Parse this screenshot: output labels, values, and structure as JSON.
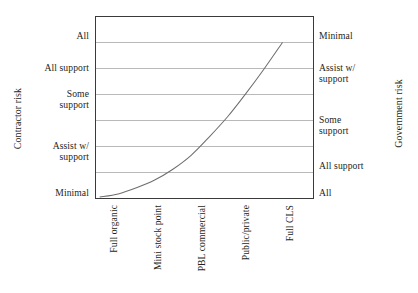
{
  "chart_data": {
    "type": "line",
    "title": "",
    "xlabel": "",
    "ylabel": "Contractor risk",
    "y2label": "Government risk",
    "grid": true,
    "legend": "none",
    "categories": [
      "Full organic",
      "Mini stock point",
      "PBL commercial",
      "Public/private",
      "Full CLS"
    ],
    "y_left_ticks": [
      "All",
      "All support",
      "Some support",
      "Assist w/ support",
      "Minimal"
    ],
    "y_right_ticks": [
      "Minimal",
      "Assist w/ support",
      "Some support",
      "All support",
      "All"
    ],
    "y_left_ticks_lines": [
      [
        "All"
      ],
      [
        "All support"
      ],
      [
        "Some",
        "support"
      ],
      [
        "Assist w/",
        "support"
      ],
      [
        "Minimal"
      ]
    ],
    "y_right_ticks_lines": [
      [
        "Minimal"
      ],
      [
        "Assist w/",
        "support"
      ],
      [
        "Some",
        "support"
      ],
      [
        "All support"
      ],
      [
        "All"
      ]
    ],
    "series": [
      {
        "name": "risk transfer curve",
        "color": "#6e6e6e",
        "x": [
          0.0,
          0.1,
          0.2,
          0.3,
          0.4,
          0.5,
          0.6,
          0.7,
          0.8,
          0.9,
          1.0
        ],
        "values": [
          0.0,
          0.02,
          0.06,
          0.11,
          0.18,
          0.27,
          0.39,
          0.52,
          0.67,
          0.83,
          1.0
        ]
      }
    ],
    "xlim": [
      0,
      1
    ],
    "ylim": [
      0,
      1
    ],
    "gridline_count": 6
  },
  "axes": {
    "left_title": "Contractor risk",
    "right_title": "Government risk"
  },
  "colors": {
    "frame": "#3a3a3a",
    "grid": "#b9b9b9",
    "curve": "#6e6e6e",
    "text": "#231f20",
    "background": "#ffffff"
  }
}
